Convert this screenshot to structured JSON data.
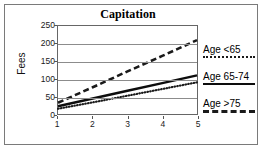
{
  "frame": {
    "border_color": "#7a7a7a"
  },
  "chart_data": {
    "type": "line",
    "title": "Capitation",
    "xlabel": "",
    "ylabel": "Fees",
    "x": [
      1,
      2,
      3,
      4,
      5
    ],
    "categories": [
      "1",
      "2",
      "3",
      "4",
      "5"
    ],
    "xlim": [
      1,
      5
    ],
    "ylim": [
      0,
      250
    ],
    "yticks": [
      0,
      50,
      100,
      150,
      200,
      250
    ],
    "ytick_labels": [
      "0",
      "50",
      "100",
      "150",
      "200",
      "250"
    ],
    "xtick_labels": [
      "1",
      "2",
      "3",
      "4",
      "5"
    ],
    "grid": "horizontal",
    "legend_position": "right",
    "series": [
      {
        "name": "Age <65",
        "style": "dotted",
        "color": "#1a1a1a",
        "values": [
          15,
          33,
          52,
          71,
          90
        ]
      },
      {
        "name": "Age 65-74",
        "style": "solid",
        "color": "#0d0d0d",
        "values": [
          22,
          44,
          66,
          88,
          110
        ]
      },
      {
        "name": "Age >75",
        "style": "dashed",
        "color": "#1a1a1a",
        "values": [
          32,
          76,
          121,
          165,
          210
        ]
      }
    ]
  },
  "legend": {
    "entries": [
      {
        "label": "Age <65",
        "key": "dotted-line-key"
      },
      {
        "label": "Age 65-74",
        "key": "solid-line-key"
      },
      {
        "label": "Age >75",
        "key": "dashed-line-key"
      }
    ]
  }
}
